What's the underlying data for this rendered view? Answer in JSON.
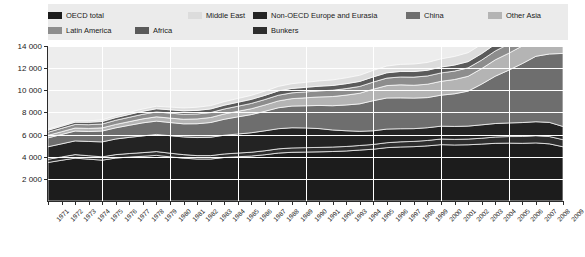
{
  "legend": {
    "items": [
      {
        "label": "OECD total",
        "color": "#1c1c1c",
        "row": 1,
        "x": 0
      },
      {
        "label": "Middle East",
        "color": "#dcdcdc",
        "row": 1,
        "x": 140
      },
      {
        "label": "Non-OECD Europe and Eurasia",
        "color": "#232323",
        "row": 1,
        "x": 205
      },
      {
        "label": "China",
        "color": "#6e6e6e",
        "row": 1,
        "x": 358
      },
      {
        "label": "Other Asia",
        "color": "#b4b4b4",
        "row": 1,
        "x": 440
      },
      {
        "label": "Latin America",
        "color": "#8d8d8d",
        "row": 2,
        "x": 0
      },
      {
        "label": "Africa",
        "color": "#5a5a5a",
        "row": 2,
        "x": 87
      },
      {
        "label": "Bunkers",
        "color": "#2e2e2e",
        "row": 2,
        "x": 205
      }
    ]
  },
  "chart_data": {
    "type": "area",
    "title": "",
    "subtitle": "",
    "xlabel": "",
    "ylabel": "",
    "stacked": true,
    "grid": true,
    "legend_position": "top",
    "ylim": [
      0,
      14000
    ],
    "yticks": [
      2000,
      4000,
      6000,
      8000,
      10000,
      12000,
      14000
    ],
    "ytick_labels": [
      "2 000",
      "4 000",
      "6 000",
      "8 000",
      "10 000",
      "12 000",
      "14 000"
    ],
    "x": [
      1971,
      1972,
      1973,
      1974,
      1975,
      1976,
      1977,
      1978,
      1979,
      1980,
      1981,
      1982,
      1983,
      1984,
      1985,
      1986,
      1987,
      1988,
      1989,
      1990,
      1991,
      1992,
      1993,
      1994,
      1995,
      1996,
      1997,
      1998,
      1999,
      2000,
      2001,
      2002,
      2003,
      2004,
      2005,
      2006,
      2007,
      2008,
      2009
    ],
    "xtick_labels": [
      "1971",
      "1972",
      "1973",
      "1974",
      "1975",
      "1976",
      "1977",
      "1978",
      "1979",
      "1980",
      "1981",
      "1982",
      "1983",
      "1984",
      "1985",
      "1986",
      "1987",
      "1988",
      "1989",
      "1990",
      "1991",
      "1992",
      "1993",
      "1994",
      "1995",
      "1996",
      "1997",
      "1998",
      "1999",
      "2000",
      "2001",
      "2002",
      "2003",
      "2004",
      "2005",
      "2006",
      "2007",
      "2008",
      "2009"
    ],
    "series": [
      {
        "name": "OECD total",
        "color": "#1c1c1c",
        "values": [
          3480,
          3680,
          3870,
          3780,
          3690,
          3880,
          3970,
          4040,
          4120,
          3990,
          3870,
          3790,
          3790,
          3930,
          4000,
          4060,
          4180,
          4330,
          4400,
          4420,
          4440,
          4470,
          4520,
          4600,
          4680,
          4820,
          4880,
          4910,
          4980,
          5090,
          5060,
          5080,
          5140,
          5210,
          5230,
          5210,
          5250,
          5160,
          4900
        ]
      },
      {
        "name": "Bunkers",
        "color": "#2e2e2e",
        "values": [
          290,
          300,
          320,
          310,
          300,
          310,
          320,
          330,
          345,
          330,
          320,
          310,
          310,
          320,
          330,
          345,
          360,
          380,
          395,
          400,
          400,
          405,
          405,
          415,
          430,
          445,
          465,
          475,
          490,
          510,
          505,
          515,
          530,
          570,
          590,
          615,
          650,
          660,
          640
        ]
      },
      {
        "name": "Non-OECD Europe and Eurasia",
        "color": "#232323",
        "values": [
          1130,
          1180,
          1240,
          1290,
          1350,
          1410,
          1460,
          1510,
          1550,
          1580,
          1600,
          1630,
          1660,
          1690,
          1720,
          1760,
          1800,
          1820,
          1820,
          1780,
          1700,
          1540,
          1420,
          1280,
          1230,
          1230,
          1180,
          1150,
          1150,
          1160,
          1170,
          1170,
          1210,
          1220,
          1230,
          1260,
          1260,
          1280,
          1190
        ]
      },
      {
        "name": "China",
        "color": "#6e6e6e",
        "values": [
          800,
          850,
          890,
          900,
          980,
          1010,
          1090,
          1180,
          1200,
          1190,
          1180,
          1250,
          1330,
          1440,
          1550,
          1640,
          1760,
          1890,
          1960,
          2000,
          2090,
          2190,
          2330,
          2480,
          2720,
          2810,
          2790,
          2760,
          2720,
          2800,
          2950,
          3160,
          3680,
          4270,
          4770,
          5330,
          5910,
          6180,
          6600
        ]
      },
      {
        "name": "Other Asia",
        "color": "#b4b4b4",
        "values": [
          230,
          250,
          270,
          275,
          285,
          310,
          330,
          360,
          390,
          400,
          415,
          435,
          455,
          480,
          500,
          530,
          570,
          620,
          670,
          720,
          770,
          830,
          890,
          960,
          1040,
          1120,
          1180,
          1160,
          1210,
          1250,
          1290,
          1340,
          1400,
          1480,
          1530,
          1590,
          1670,
          1730,
          1790
        ]
      },
      {
        "name": "Latin America",
        "color": "#8d8d8d",
        "values": [
          280,
          300,
          325,
          340,
          350,
          375,
          395,
          415,
          440,
          450,
          450,
          450,
          440,
          450,
          460,
          480,
          495,
          515,
          525,
          535,
          550,
          570,
          590,
          615,
          645,
          675,
          710,
          735,
          745,
          760,
          760,
          765,
          770,
          800,
          830,
          855,
          890,
          920,
          900
        ]
      },
      {
        "name": "Africa",
        "color": "#5a5a5a",
        "values": [
          180,
          190,
          205,
          215,
          225,
          240,
          255,
          270,
          285,
          300,
          310,
          320,
          330,
          340,
          355,
          365,
          375,
          390,
          400,
          410,
          420,
          430,
          440,
          450,
          465,
          480,
          495,
          505,
          515,
          530,
          545,
          560,
          585,
          610,
          630,
          650,
          680,
          700,
          710
        ]
      },
      {
        "name": "Middle East",
        "color": "#dcdcdc",
        "values": [
          95,
          105,
          120,
          130,
          145,
          165,
          185,
          205,
          225,
          240,
          260,
          280,
          300,
          320,
          340,
          360,
          380,
          405,
          425,
          450,
          475,
          500,
          530,
          555,
          585,
          610,
          640,
          675,
          705,
          735,
          775,
          805,
          840,
          890,
          940,
          980,
          1030,
          1090,
          1140
        ]
      }
    ],
    "totals": [
      6485,
      6855,
      7240,
      7240,
      7325,
      7700,
      8005,
      8310,
      8555,
      8480,
      8405,
      8465,
      8615,
      8970,
      9255,
      9540,
      9920,
      10350,
      10595,
      10715,
      10845,
      10935,
      11125,
      11355,
      11795,
      12190,
      12340,
      12370,
      12515,
      12835,
      13055,
      13395,
      14155,
      15050,
      15750,
      16490,
      17340,
      17720,
      17870
    ]
  }
}
